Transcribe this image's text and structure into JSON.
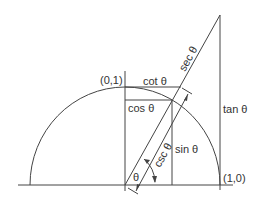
{
  "diagram": {
    "labels": {
      "point_top": "(0,1)",
      "point_right": "(1,0)",
      "cot": "cot θ",
      "cos": "cos θ",
      "sin": "sin θ",
      "tan": "tan θ",
      "sec": "sec θ",
      "csc": "csc θ",
      "theta": "θ"
    },
    "colors": {
      "line": "#444444",
      "text": "#333333",
      "background": "#ffffff"
    }
  }
}
